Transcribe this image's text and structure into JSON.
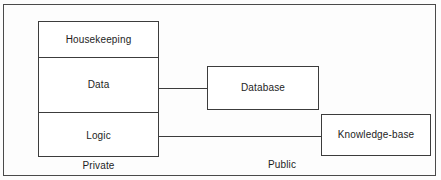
{
  "diagram": {
    "stroke_color": "#3c3c3c",
    "background_color": "#fdfdfd",
    "frame": {
      "name": "outer-frame"
    },
    "private_stack": {
      "cells": [
        {
          "label": "Housekeeping"
        },
        {
          "label": "Data"
        },
        {
          "label": "Logic"
        }
      ]
    },
    "public_boxes": [
      {
        "label": "Database"
      },
      {
        "label": "Knowledge-base"
      }
    ],
    "connectors": [
      {
        "from": "Data",
        "to": "Database"
      },
      {
        "from": "Logic",
        "to": "Knowledge-base"
      }
    ],
    "zone_labels": {
      "private": "Private",
      "public": "Public"
    }
  }
}
